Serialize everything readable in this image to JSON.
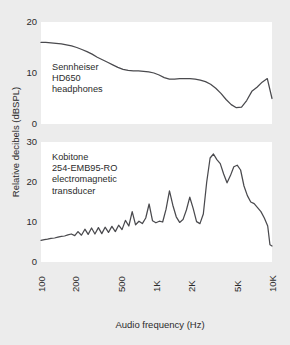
{
  "chart_data": {
    "type": "line",
    "title": "",
    "xlabel": "Audio frequency (Hz)",
    "ylabel": "Relative decibels (dBSPL)",
    "xscale": "log",
    "xlim": [
      100,
      10000
    ],
    "xticks": [
      100,
      200,
      500,
      1000,
      2000,
      5000,
      10000
    ],
    "xticklabels": [
      "100",
      "200",
      "500",
      "1K",
      "2K",
      "5K",
      "10K"
    ],
    "grid": false,
    "legend_position": "inside-annotation",
    "panels": [
      {
        "id": "top",
        "annotation": "Sennheiser\nHD650\nheadphones",
        "annotation_lines": [
          "Sennheiser",
          "HD650",
          "headphones"
        ],
        "ylim": [
          0,
          20
        ],
        "yticks": [
          0,
          10,
          20
        ],
        "yticklabels": [
          "0",
          "10",
          "20"
        ],
        "series": [
          {
            "name": "Sennheiser HD650 headphones",
            "x": [
              100,
              110,
              122,
              135,
              150,
              166,
              184,
              204,
              226,
              250,
              277,
              307,
              340,
              377,
              418,
              463,
              513,
              568,
              630,
              698,
              773,
              857,
              950,
              1053,
              1167,
              1293,
              1433,
              1588,
              1760,
              1950,
              2161,
              2395,
              2654,
              2941,
              3259,
              3612,
              4003,
              4436,
              4916,
              5448,
              6037,
              6691,
              7415,
              8217,
              9107,
              10000
            ],
            "y": [
              16.0,
              16.0,
              15.9,
              15.8,
              15.7,
              15.5,
              15.3,
              15.0,
              14.6,
              14.2,
              13.7,
              13.1,
              12.6,
              12.1,
              11.6,
              11.1,
              10.7,
              10.5,
              10.4,
              10.4,
              10.3,
              10.2,
              10.0,
              9.6,
              9.1,
              8.8,
              8.8,
              8.9,
              8.9,
              8.9,
              8.8,
              8.6,
              8.3,
              7.8,
              7.0,
              6.0,
              4.8,
              3.8,
              3.2,
              3.3,
              4.6,
              6.4,
              7.2,
              8.2,
              8.9,
              5.0
            ]
          }
        ]
      },
      {
        "id": "bottom",
        "annotation": "Kobitone\n254-EMB95-RO\nelectromagnetic\ntransducer",
        "annotation_lines": [
          "Kobitone",
          "254-EMB95-RO",
          "electromagnetic",
          "transducer"
        ],
        "ylim": [
          0,
          30
        ],
        "yticks": [
          0,
          10,
          20,
          30
        ],
        "yticklabels": [
          "0",
          "10",
          "20",
          "30"
        ],
        "series": [
          {
            "name": "Kobitone 254-EMB95-RO electromagnetic transducer",
            "x": [
              100,
              107,
              114,
              122,
              131,
              140,
              150,
              160,
              171,
              183,
              196,
              209,
              224,
              240,
              256,
              274,
              293,
              314,
              336,
              359,
              384,
              411,
              440,
              470,
              503,
              538,
              576,
              616,
              659,
              705,
              754,
              807,
              863,
              924,
              988,
              1057,
              1131,
              1210,
              1295,
              1385,
              1482,
              1586,
              1696,
              1815,
              1942,
              2077,
              2222,
              2378,
              2543,
              2721,
              2911,
              3114,
              3332,
              3565,
              3814,
              4081,
              4366,
              4671,
              4997,
              5347,
              5720,
              6120,
              6548,
              7006,
              7496,
              8020,
              8580,
              9180,
              9600,
              10000
            ],
            "y": [
              5.4,
              5.6,
              5.7,
              5.9,
              6.0,
              6.2,
              6.4,
              6.5,
              6.8,
              7.0,
              6.6,
              7.6,
              6.7,
              8.2,
              6.9,
              8.5,
              7.0,
              8.6,
              7.1,
              8.7,
              7.4,
              8.9,
              7.6,
              9.2,
              8.1,
              10.4,
              9.0,
              12.6,
              9.3,
              10.2,
              9.6,
              11.0,
              14.5,
              10.3,
              9.8,
              10.2,
              10.0,
              13.2,
              17.8,
              14.2,
              11.3,
              9.9,
              10.6,
              13.0,
              16.2,
              13.4,
              10.1,
              9.6,
              12.0,
              20.0,
              26.0,
              27.0,
              25.6,
              24.6,
              22.0,
              19.8,
              21.6,
              23.8,
              24.2,
              23.0,
              19.0,
              16.6,
              15.0,
              14.6,
              13.6,
              12.6,
              11.0,
              9.0,
              4.3,
              4.0
            ]
          }
        ]
      }
    ]
  }
}
